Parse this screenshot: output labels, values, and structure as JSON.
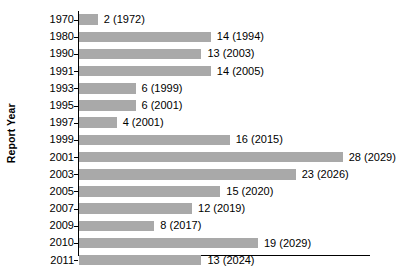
{
  "chart_data": {
    "type": "bar",
    "orientation": "horizontal",
    "title": "",
    "xlabel": "",
    "ylabel": "Report Year",
    "categories": [
      "1970",
      "1980",
      "1990",
      "1991",
      "1993",
      "1995",
      "1997",
      "1999",
      "2001",
      "2003",
      "2005",
      "2007",
      "2009",
      "2010",
      "2011"
    ],
    "values": [
      2,
      14,
      13,
      14,
      6,
      6,
      4,
      16,
      28,
      23,
      15,
      12,
      8,
      19,
      13
    ],
    "point_labels": [
      "2 (1972)",
      "14 (1994)",
      "13 (2003)",
      "14 (2005)",
      "6 (1999)",
      "6 (2001)",
      "4 (2001)",
      "16 (2015)",
      "28 (2029)",
      "23 (2026)",
      "15 (2020)",
      "12 (2019)",
      "8 (2017)",
      "19 (2029)",
      "13 (2024)"
    ],
    "annotation_years": [
      "1972",
      "1994",
      "2003",
      "2005",
      "1999",
      "2001",
      "2001",
      "2015",
      "2029",
      "2026",
      "2020",
      "2019",
      "2017",
      "2029",
      "2024"
    ],
    "xlim": [
      0,
      31
    ],
    "grid": false,
    "legend": "none",
    "bar_color": "#a9a9a9",
    "axis_color": "#000000",
    "background_color": "#ffffff"
  },
  "axes": {
    "y_title": "Report Year"
  },
  "rows": [
    {
      "category": "1970",
      "value": 2,
      "label": "2 (1972)"
    },
    {
      "category": "1980",
      "value": 14,
      "label": "14 (1994)"
    },
    {
      "category": "1990",
      "value": 13,
      "label": "13 (2003)"
    },
    {
      "category": "1991",
      "value": 14,
      "label": "14 (2005)"
    },
    {
      "category": "1993",
      "value": 6,
      "label": "6 (1999)"
    },
    {
      "category": "1995",
      "value": 6,
      "label": "6 (2001)"
    },
    {
      "category": "1997",
      "value": 4,
      "label": "4 (2001)"
    },
    {
      "category": "1999",
      "value": 16,
      "label": "16 (2015)"
    },
    {
      "category": "2001",
      "value": 28,
      "label": "28 (2029)"
    },
    {
      "category": "2003",
      "value": 23,
      "label": "23 (2026)"
    },
    {
      "category": "2005",
      "value": 15,
      "label": "15 (2020)"
    },
    {
      "category": "2007",
      "value": 12,
      "label": "12 (2019)"
    },
    {
      "category": "2009",
      "value": 8,
      "label": "8 (2017)"
    },
    {
      "category": "2010",
      "value": 19,
      "label": "19 (2029)"
    },
    {
      "category": "2011",
      "value": 13,
      "label": "13 (2024)"
    }
  ]
}
